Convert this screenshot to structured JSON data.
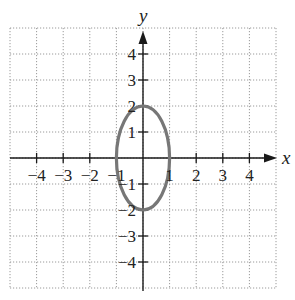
{
  "chart_data": {
    "type": "line",
    "title": "",
    "xlabel": "x",
    "ylabel": "y",
    "xlim": [
      -5,
      5
    ],
    "ylim": [
      -5,
      5
    ],
    "grid": true,
    "legend": null,
    "x_ticks": [
      -4,
      -3,
      -2,
      -1,
      1,
      2,
      3,
      4
    ],
    "y_ticks": [
      -4,
      -3,
      -2,
      -1,
      1,
      2,
      3,
      4
    ],
    "x_tick_labels": [
      "−4",
      "−3",
      "−2",
      "−1",
      "1",
      "2",
      "3",
      "4"
    ],
    "y_tick_labels": [
      "−4",
      "−3",
      "−2",
      "−1",
      "1",
      "2",
      "3",
      "4"
    ],
    "series": [
      {
        "name": "ellipse",
        "shape": "ellipse",
        "center": [
          0,
          0
        ],
        "semi_axis_x": 1,
        "semi_axis_y": 2,
        "equation": "x^2 + y^2/4 = 1",
        "color": "#777777",
        "key_points": [
          [
            1,
            0
          ],
          [
            0,
            2
          ],
          [
            -1,
            0
          ],
          [
            0,
            -2
          ]
        ]
      }
    ]
  },
  "labels": {
    "x_axis": "x",
    "y_axis": "y"
  },
  "colors": {
    "curve": "#777777",
    "axis": "#1a1a1a",
    "grid": "#9a9a9a"
  }
}
